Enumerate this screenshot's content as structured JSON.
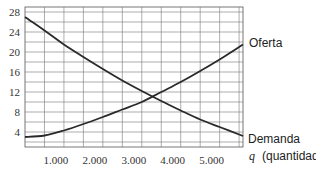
{
  "chart_data": {
    "type": "line",
    "title": "",
    "xlabel": "q (quantidade)",
    "xlabel_var": "q",
    "xlabel_text": "(quantidade)",
    "ylabel": "",
    "xlim": [
      0,
      5600
    ],
    "ylim": [
      1,
      29
    ],
    "x_ticks": [
      1000,
      2000,
      3000,
      4000,
      5000
    ],
    "x_tick_labels": [
      "1.000",
      "2.000",
      "3.000",
      "4.000",
      "5.000"
    ],
    "y_ticks": [
      4,
      8,
      12,
      16,
      20,
      24,
      28
    ],
    "y_tick_labels": [
      "4",
      "8",
      "12",
      "16",
      "20",
      "24",
      "28"
    ],
    "grid": true,
    "grid_x_step": 500,
    "grid_y_step": 2,
    "legend": "inline labels at right end of curves",
    "series": [
      {
        "name": "Oferta",
        "x": [
          0,
          500,
          1000,
          1500,
          2000,
          2500,
          3000,
          3500,
          4000,
          4500,
          5000,
          5600
        ],
        "values": [
          3.0,
          3.3,
          4.3,
          5.6,
          7.0,
          8.5,
          10.0,
          12.0,
          14.0,
          16.2,
          18.5,
          21.5
        ]
      },
      {
        "name": "Demanda",
        "x": [
          0,
          500,
          1000,
          1500,
          2000,
          2500,
          3000,
          3500,
          4000,
          4500,
          5000,
          5600
        ],
        "values": [
          27.0,
          24.3,
          21.5,
          19.0,
          16.6,
          14.3,
          12.2,
          10.2,
          8.3,
          6.5,
          5.0,
          3.2
        ]
      }
    ],
    "annotations": [
      {
        "text": "Oferta",
        "anchor": "end of supply curve"
      },
      {
        "text": "Demanda",
        "anchor": "end of demand curve"
      }
    ]
  },
  "labels": {
    "supply": "Oferta",
    "demand": "Demanda",
    "x_var": "q",
    "x_text": "(quantidade)"
  }
}
